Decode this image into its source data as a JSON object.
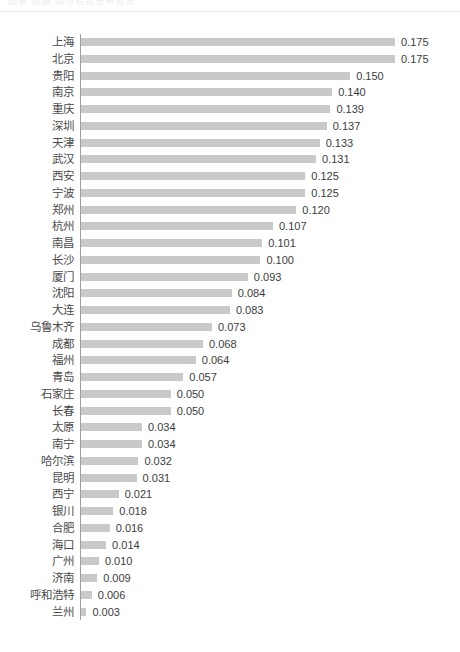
{
  "header": {
    "ghost_text": "图表 数据      城市指数分布情况"
  },
  "chart_data": {
    "type": "bar",
    "orientation": "horizontal",
    "title": "",
    "subtitle": "",
    "xlabel": "",
    "ylabel": "",
    "xlim": [
      0,
      0.175
    ],
    "grid": false,
    "legend": null,
    "value_format": "0.000",
    "bar_color": "#c9c9c9",
    "axis_color": "#9aa0a6",
    "categories": [
      "上海",
      "北京",
      "贵阳",
      "南京",
      "重庆",
      "深圳",
      "天津",
      "武汉",
      "西安",
      "宁波",
      "郑州",
      "杭州",
      "南昌",
      "长沙",
      "厦门",
      "沈阳",
      "大连",
      "乌鲁木齐",
      "成都",
      "福州",
      "青岛",
      "石家庄",
      "长春",
      "太原",
      "南宁",
      "哈尔滨",
      "昆明",
      "西宁",
      "银川",
      "合肥",
      "海口",
      "广州",
      "济南",
      "呼和浩特",
      "兰州"
    ],
    "values": [
      0.175,
      0.175,
      0.15,
      0.14,
      0.139,
      0.137,
      0.133,
      0.131,
      0.125,
      0.125,
      0.12,
      0.107,
      0.101,
      0.1,
      0.093,
      0.084,
      0.083,
      0.073,
      0.068,
      0.064,
      0.057,
      0.05,
      0.05,
      0.034,
      0.034,
      0.032,
      0.031,
      0.021,
      0.018,
      0.016,
      0.014,
      0.01,
      0.009,
      0.006,
      0.003
    ],
    "value_labels": [
      "0.175",
      "0.175",
      "0.150",
      "0.140",
      "0.139",
      "0.137",
      "0.133",
      "0.131",
      "0.125",
      "0.125",
      "0.120",
      "0.107",
      "0.101",
      "0.100",
      "0.093",
      "0.084",
      "0.083",
      "0.073",
      "0.068",
      "0.064",
      "0.057",
      "0.050",
      "0.050",
      "0.034",
      "0.034",
      "0.032",
      "0.031",
      "0.021",
      "0.018",
      "0.016",
      "0.014",
      "0.010",
      "0.009",
      "0.006",
      "0.003"
    ]
  }
}
